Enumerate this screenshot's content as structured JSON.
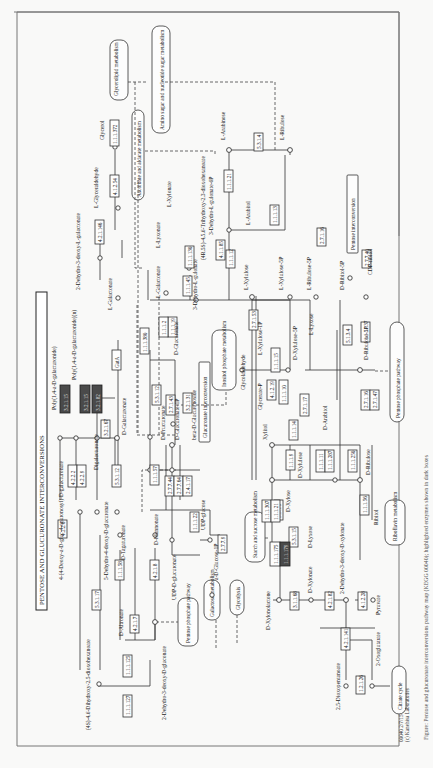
{
  "title": "PENTOSE AND GLUCURONATE INTERCONVERSIONS",
  "footer": {
    "map_id": "00040 2/7/15",
    "copyright": "(c) Kanehisa Laboratories"
  },
  "caption": "Figure: Pentose and glucuronate interconversions pathway map (KEGG 00040); highlighted enzymes shown in dark boxes",
  "colors": {
    "highlight": "#4a4a4a",
    "line": "#333333",
    "background": "#f9f9f8"
  },
  "maps": [
    {
      "id": "glycerolipid",
      "label": "Glycerolipid metabolism"
    },
    {
      "id": "amino-sugar",
      "label": "Amino sugar and nucleotide sugar metabolism"
    },
    {
      "id": "ascorbate",
      "label": "Ascorbate and aldarate metabolism"
    },
    {
      "id": "inositol",
      "label": "Inositol phosphate metabolism"
    },
    {
      "id": "pentose-interconv",
      "label": "Pentose interconversion"
    },
    {
      "id": "glucuronate-interconv",
      "label": "Glucuronate interconversion"
    },
    {
      "id": "pentose-phosphate-1",
      "label": "Pentose phosphate pathway"
    },
    {
      "id": "pentose-phosphate-2",
      "label": "Pentose phosphate pathway"
    },
    {
      "id": "starch",
      "label": "Starch and sucrose metabolism"
    },
    {
      "id": "galactose",
      "label": "Galactose metabolism"
    },
    {
      "id": "glycolysis",
      "label": "Glycolysis"
    },
    {
      "id": "riboflavin",
      "label": "Riboflavin metabolism"
    },
    {
      "id": "citrate",
      "label": "Citrate cycle"
    }
  ],
  "compounds": [
    "Glycerol",
    "L-Glyceraldehyde",
    "2-Dehydro-3-deoxy-L-galactonate",
    "L-Galactonate",
    "L-Galactonate",
    "3-Dehydro-L-gulonate",
    "L-Lyxonate",
    "L-Xylonate",
    "(4R,5S)-4,5,6-Trihydroxy-2,3-dioxohexanoate",
    "3-Dehydro-L-gulonate-6P",
    "L-Arabinose",
    "L-Ribulose",
    "L-Arabitol",
    "L-Xylulose",
    "L-Xylulose-5P",
    "L-Ribulose-5P",
    "D-Ribitol-5P",
    "CDP-ribitol",
    "Poly(1,4-a-D-galacturonide)",
    "Poly(1,4-a-D-galacturonide)(n)",
    "Digalacturonate",
    "D-Galacturonate",
    "D-Fructuronate",
    "D-Glucuronate-1P",
    "beta-D-Glucuronoside",
    "D-Glucuronate",
    "Glycolaldehyde",
    "Glycerate-P",
    "L-Xylulose-1P",
    "Xylitol",
    "D-Xylulose",
    "D-Xylulose-5P",
    "L-Lyxose",
    "D-Arabitol",
    "D-Ribulose",
    "D-Ribulose-5P",
    "D-Xylose",
    "D-Lyxose",
    "Ribitol",
    "4-(4-Deoxy-a-D-gluc-4-enuronosyl)-D-galacturonate",
    "5-Dehydro-4-deoxy-D-glucuronate",
    "D-Tagaturonate",
    "D-Mannonate",
    "D-Altronate",
    "UDP-D-glucuronate",
    "UDP-glucose",
    "a-D-Glucose-1P",
    "(4S)-4,6-Dihydroxy-2,5-dioxohexanoate",
    "2-Dehydro-3-deoxy-D-gluconate",
    "D-Xylonolactone",
    "D-Xylonate",
    "2-Dehydro-3-deoxy-D-xylonate",
    "Pyruvate",
    "2,5-Dioxopentanoate",
    "2-Oxoglutarate"
  ],
  "enzymes": {
    "glycerol": "1.1.1.372",
    "glyceraldehyde": "4.1.2.54",
    "galactonate_dehydratase": "4.2.1.146",
    "galactonate_dh": "1.1.1.380",
    "uronate_red": "GatA",
    "gulonate_a": "1.1.1.45",
    "gulonate_b": "1.1.1.19",
    "gulonate_c": "1.1.1.2",
    "lyxonate": "1.1.1.130",
    "decarbox": "4.1.1.85",
    "arabinose_iso": "5.3.1.4",
    "arabitol_dh": "1.1.1.12",
    "arabinose_red": "1.1.1.21",
    "ribulose_red": "1.1.1.13",
    "cdp_ribitol": "2.7.7.40",
    "ribitol_kin": "2.7.1.16",
    "polygal_a": "3.2.1.15",
    "polygal_b": "3.2.1.67",
    "polygal_c": "3.2.1.82",
    "lyase_a": "4.2.2.2",
    "lyase_b": "4.2.2.9",
    "isomerase": "5.3.1.12",
    "fructuronate": "5.3.1.12",
    "glucuronate_kin": "2.7.1.43",
    "glucuronidase": "3.2.1.31",
    "udp_a": "2.7.7.44",
    "udp_b": "2.7.7.64",
    "udp_c": "2.4.1.17",
    "mannonate_red": "1.1.1.57",
    "xylulose1p": "4.1.2.19",
    "xylulose_kin_a": "2.7.1.53",
    "xylitol_a": "1.1.1.15",
    "xylitol_b": "1.1.1.10",
    "xylitol_c": "1.1.1.9",
    "xylitol_d": "1.1.1.14",
    "xylose_iso": "5.3.1.5",
    "xylulose_kin": "2.7.1.17",
    "lyxose_iso": "5.3.1.15",
    "arabitol_a": "1.1.1.11",
    "arabitol_b": "1.1.1.287",
    "ribulose_kin": "2.7.1.47",
    "epimerase": "5.1.3.4",
    "ribitol_dh": "1.1.1.56",
    "ribitol_5p": "1.1.1.137",
    "d_arabitol": "1.1.1.250",
    "xylose_red_a": "1.1.1.307",
    "xylose_red_b": "1.1.1.21",
    "altronate_dh": "4.2.1.7",
    "tagaturonate": "1.1.1.58",
    "mannonate_dh": "4.2.1.8",
    "isomerase_2": "5.3.1.17",
    "kduD_a": "1.1.1.127",
    "kduD_b": "1.1.1.125",
    "lyase_c": "4.2.2.6",
    "xylose_dh_a": "1.1.1.175",
    "xylose_dh_b": "1.1.1.179",
    "xylonolactonase": "3.1.1.68",
    "xylonate_dehydratase": "4.2.1.82",
    "aldolase": "4.1.2.28",
    "kdx_dehydratase": "4.2.1.141",
    "ald_dh": "1.2.1.26",
    "glucose1p": "2.7.7.9",
    "udpgdh": "1.1.1.22"
  }
}
